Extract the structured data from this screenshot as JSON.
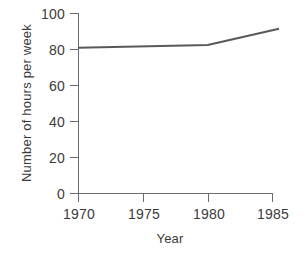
{
  "chart_data": {
    "type": "line",
    "title": "",
    "xlabel": "Year",
    "ylabel": "Number of hours per week",
    "x": [
      1970,
      1980,
      1985.5
    ],
    "values": [
      81,
      82.5,
      91.5
    ],
    "series": [
      {
        "name": "Number of hours per week",
        "points": [
          {
            "x": 1970,
            "y": 81
          },
          {
            "x": 1980,
            "y": 82.5
          },
          {
            "x": 1985.5,
            "y": 91.5
          }
        ]
      }
    ],
    "xlim": [
      1970,
      1985.5
    ],
    "ylim": [
      0,
      100
    ],
    "xticks": [
      1970,
      1975,
      1980,
      1985
    ],
    "yticks": [
      0,
      20,
      40,
      60,
      80,
      100
    ],
    "xtick_labels": [
      "1970",
      "1975",
      "1980",
      "1985"
    ],
    "ytick_labels": [
      "0",
      "20",
      "40",
      "60",
      "80",
      "100"
    ],
    "grid": false,
    "legend": false,
    "line_color": "#595959",
    "axis_color": "#6b6b6b",
    "text_color": "#3b3b3b",
    "background_color": "#ffffff"
  }
}
